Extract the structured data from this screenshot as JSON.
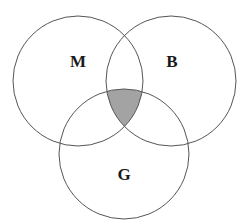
{
  "diagram": {
    "type": "venn",
    "sets": [
      {
        "label": "M",
        "cx": 78,
        "cy": 81,
        "r": 65,
        "label_x": 78,
        "label_y": 61
      },
      {
        "label": "B",
        "cx": 171,
        "cy": 81,
        "r": 65,
        "label_x": 172,
        "label_y": 61
      },
      {
        "label": "G",
        "cx": 124,
        "cy": 154,
        "r": 65,
        "label_x": 124,
        "label_y": 174
      }
    ],
    "shaded_region": "M ∩ B ∩ G",
    "colors": {
      "stroke": "#555555",
      "shade": "#a3a3a3",
      "label": "#1a1a1a",
      "background": "#ffffff"
    }
  }
}
